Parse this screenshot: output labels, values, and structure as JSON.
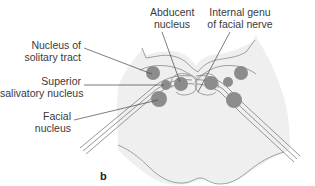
{
  "figure": {
    "panel_letter": "b",
    "labels": {
      "abducent": [
        "Abducent",
        "nucleus"
      ],
      "genu": [
        "Internal genu",
        "of facial nerve"
      ],
      "solitary": [
        "Nucleus of",
        "solitary tract"
      ],
      "salivatory": [
        "Superior",
        "salivatory nucleus"
      ],
      "facial": [
        "Facial",
        "nucleus"
      ]
    },
    "colors": {
      "tissue_fill": "#efefef",
      "outline": "#8a8a8a",
      "nucleus_fill": "#8c8c8c",
      "leader_line": "#444444",
      "text": "#3a3a3a"
    }
  }
}
